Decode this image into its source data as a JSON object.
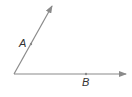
{
  "diagram": {
    "type": "angle",
    "colors": {
      "ray": "#8a8a8a",
      "label": "#333333",
      "background": "#ffffff"
    },
    "vertex": {
      "x": 14,
      "y": 74
    },
    "rays": [
      {
        "name": "ray-upper",
        "end": {
          "x": 53,
          "y": 5
        }
      },
      {
        "name": "ray-horizontal",
        "end": {
          "x": 127,
          "y": 74
        }
      }
    ],
    "points": [
      {
        "label": "A",
        "x": 31,
        "y": 44,
        "label_x": 19,
        "label_y": 47
      },
      {
        "label": "B",
        "x": 86,
        "y": 74,
        "label_x": 82,
        "label_y": 86
      }
    ]
  }
}
